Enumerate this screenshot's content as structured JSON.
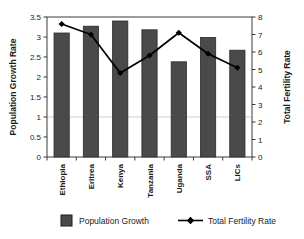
{
  "chart_data": {
    "type": "bar",
    "title": "",
    "subtitle": "",
    "categories": [
      "Ethiopia",
      "Eritrea",
      "Kenya",
      "Tanzania",
      "Uganda",
      "SSA",
      "LICs"
    ],
    "xlabel": "",
    "series": [
      {
        "name": "Population Growth",
        "type": "bar",
        "axis": "left",
        "values": [
          3.1,
          3.27,
          3.4,
          3.18,
          2.38,
          2.99,
          2.67
        ],
        "color": "#4a4a4a"
      },
      {
        "name": "Total Fertility Rate",
        "type": "line",
        "axis": "right",
        "values": [
          7.6,
          7.0,
          4.8,
          5.8,
          7.1,
          5.9,
          5.1
        ],
        "color": "#000000",
        "marker": "diamond"
      }
    ],
    "axes": {
      "left": {
        "label": "Population Growth Rate",
        "ylim": [
          0,
          3.5
        ],
        "ticks": [
          "0",
          "0.5",
          "1",
          "1.5",
          "2",
          "2.5",
          "3",
          "3.5"
        ],
        "tick_values": [
          0,
          0.5,
          1,
          1.5,
          2,
          2.5,
          3,
          3.5
        ]
      },
      "right": {
        "label": "Total Fertility Rate",
        "ylim": [
          0,
          8
        ],
        "ticks": [
          "0",
          "1",
          "2",
          "3",
          "4",
          "5",
          "6",
          "7",
          "8"
        ],
        "tick_values": [
          0,
          1,
          2,
          3,
          4,
          5,
          6,
          7,
          8
        ]
      }
    },
    "grid": true,
    "gridlines_at": [
      1
    ],
    "legend": {
      "position": "bottom",
      "entries": [
        {
          "label": "Population Growth",
          "swatch": "bar",
          "color": "#4a4a4a"
        },
        {
          "label": "Total Fertility Rate",
          "swatch": "line-marker",
          "color": "#000000"
        }
      ]
    }
  }
}
